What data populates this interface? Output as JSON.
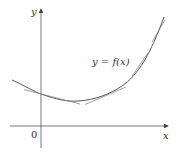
{
  "diagram": {
    "axes": {
      "x_label": "x",
      "y_label": "y",
      "origin_label": "0"
    },
    "curve": {
      "label": "y = f(x)",
      "color": "#555555",
      "description": "concave upward curve"
    },
    "tangent_lines": {
      "count": 4,
      "color": "#888888"
    },
    "axis_color": "#444444"
  }
}
